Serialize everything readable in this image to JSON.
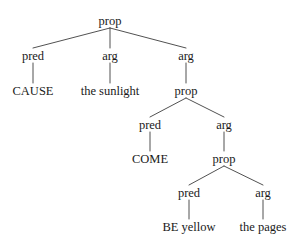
{
  "figure": {
    "kind": "semantic-decomposition-tree",
    "width": 301,
    "height": 243,
    "background_color": "#ffffff",
    "line_color": "#3d3d3d",
    "text_color": "#1a1a1a",
    "font_size_px": 12.5
  },
  "chart_data": {
    "type": "tree",
    "title": "",
    "orientation": "top-down",
    "node_labels": [
      "prop",
      "pred",
      "arg",
      "arg",
      "CAUSE",
      "the sunlight",
      "prop",
      "pred",
      "arg",
      "COME",
      "prop",
      "pred",
      "arg",
      "BE yellow",
      "the pages"
    ],
    "leaf_labels": [
      "CAUSE",
      "the sunlight",
      "COME",
      "BE yellow",
      "the pages"
    ],
    "category_labels": [
      "prop",
      "pred",
      "arg"
    ],
    "edges": [
      [
        "prop-1",
        "pred-1"
      ],
      [
        "prop-1",
        "arg-1"
      ],
      [
        "prop-1",
        "arg-2"
      ],
      [
        "pred-1",
        "CAUSE"
      ],
      [
        "arg-1",
        "the sunlight"
      ],
      [
        "arg-2",
        "prop-2"
      ],
      [
        "prop-2",
        "pred-2"
      ],
      [
        "prop-2",
        "arg-3"
      ],
      [
        "pred-2",
        "COME"
      ],
      [
        "arg-3",
        "prop-3"
      ],
      [
        "prop-3",
        "pred-3"
      ],
      [
        "prop-3",
        "arg-4"
      ],
      [
        "pred-3",
        "BE yellow"
      ],
      [
        "arg-4",
        "the pages"
      ]
    ]
  },
  "tree": {
    "id": "prop-1",
    "label": "prop",
    "role": "category",
    "x": 110,
    "y": 25,
    "children": [
      {
        "id": "pred-1",
        "label": "pred",
        "role": "category",
        "x": 33,
        "y": 60,
        "children": [
          {
            "id": "CAUSE",
            "label": "CAUSE",
            "role": "leaf",
            "x": 33,
            "y": 95,
            "children": []
          }
        ]
      },
      {
        "id": "arg-1",
        "label": "arg",
        "role": "category",
        "x": 110,
        "y": 60,
        "children": [
          {
            "id": "the-sunlight",
            "label": "the sunlight",
            "role": "leaf",
            "x": 110,
            "y": 95,
            "children": []
          }
        ]
      },
      {
        "id": "arg-2",
        "label": "arg",
        "role": "category",
        "x": 186,
        "y": 60,
        "children": [
          {
            "id": "prop-2",
            "label": "prop",
            "role": "category",
            "x": 186,
            "y": 95,
            "children": [
              {
                "id": "pred-2",
                "label": "pred",
                "role": "category",
                "x": 150,
                "y": 129,
                "children": [
                  {
                    "id": "COME",
                    "label": "COME",
                    "role": "leaf",
                    "x": 150,
                    "y": 163,
                    "children": []
                  }
                ]
              },
              {
                "id": "arg-3",
                "label": "arg",
                "role": "category",
                "x": 224,
                "y": 129,
                "children": [
                  {
                    "id": "prop-3",
                    "label": "prop",
                    "role": "category",
                    "x": 224,
                    "y": 163,
                    "children": [
                      {
                        "id": "pred-3",
                        "label": "pred",
                        "role": "category",
                        "x": 189,
                        "y": 197,
                        "children": [
                          {
                            "id": "BE-yellow",
                            "label": "BE yellow",
                            "role": "leaf",
                            "x": 189,
                            "y": 231,
                            "children": []
                          }
                        ]
                      },
                      {
                        "id": "arg-4",
                        "label": "arg",
                        "role": "category",
                        "x": 263,
                        "y": 197,
                        "children": [
                          {
                            "id": "the-pages",
                            "label": "the pages",
                            "role": "leaf",
                            "x": 263,
                            "y": 231,
                            "children": []
                          }
                        ]
                      }
                    ]
                  }
                ]
              }
            ]
          }
        ]
      }
    ]
  }
}
